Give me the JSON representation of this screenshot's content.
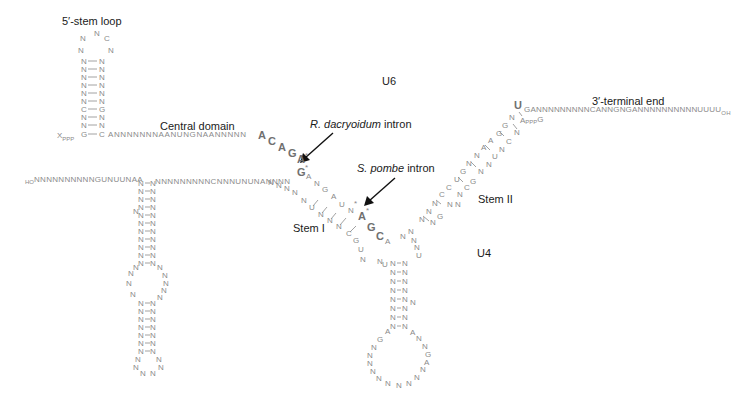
{
  "labels": {
    "stem_loop_5": "5′-stem loop",
    "central_domain": "Central domain",
    "u6": "U6",
    "u4": "U4",
    "terminal_3": "3′-terminal end",
    "stem_1": "Stem I",
    "stem_2": "Stem II",
    "r_dacryoidum_species": "R. dacryoidum",
    "r_dacryoidum_suffix": " intron",
    "s_pombe_species": "S. pombe",
    "s_pombe_suffix": " intron"
  },
  "u6": {
    "cap_5": "X",
    "cap_5_sub": "PPP",
    "central_seq": "ANNNNNNNAANUNGNAANNNNN",
    "highlight_seq": [
      "A",
      "C",
      "A",
      "G",
      "A*",
      "G*"
    ],
    "terminal_seq": "GANNNNNNNNNCANNGNGANNNNNNNNNNUUUU",
    "terminal_oh": "OH",
    "cap_3_mid": "A",
    "cap_3_sub": "PPP",
    "cap_3_end": "G"
  },
  "u4": {
    "ho": "HO",
    "left_seq": "NNNNNNNNNNGUNUUNAA",
    "mid_seq": "NNNNNNNNNCNNNUNUNANNNN"
  },
  "colors": {
    "nucleotide": "#8a8a8a",
    "highlight": "#707070",
    "label": "#1a1a1a",
    "arrow": "#111111"
  }
}
